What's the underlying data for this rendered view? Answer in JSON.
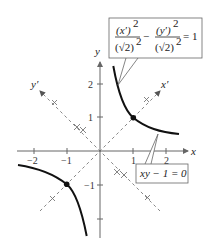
{
  "diagram": {
    "type": "rotated-hyperbola",
    "axes": {
      "x_label": "x",
      "y_label": "y",
      "x_ticks": [
        "−2",
        "−1",
        "1",
        "2"
      ],
      "y_ticks": [
        "2",
        "1",
        "−1"
      ],
      "rotated_x_label": "x′",
      "rotated_y_label": "y′"
    },
    "equations": {
      "rotated_form": {
        "num1": "(x′)",
        "num2": "(y′)",
        "den": "(√2)",
        "exp": "2",
        "minus": "−",
        "equals": "= 1"
      },
      "original_form": "xy − 1 = 0"
    },
    "vertices": [
      {
        "x": 1,
        "y": 1
      },
      {
        "x": -1,
        "y": -1
      }
    ],
    "colors": {
      "curve": "#111111",
      "axis": "#777777",
      "rotated_axis": "#888888",
      "label_border": "#666666"
    }
  }
}
